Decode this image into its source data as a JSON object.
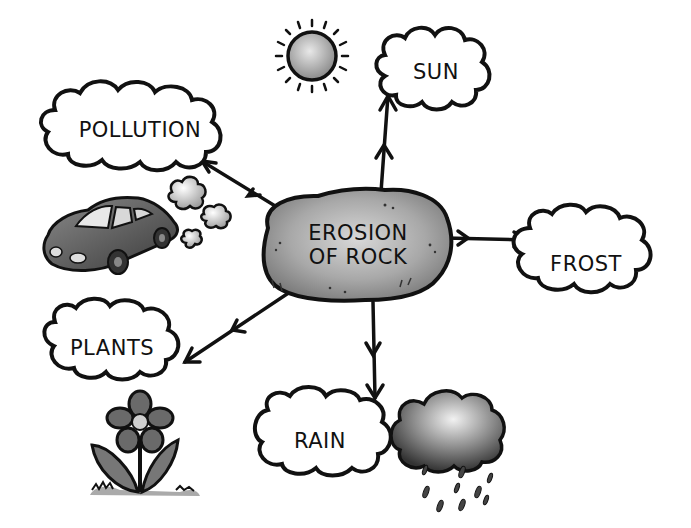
{
  "diagram": {
    "type": "concept-map",
    "center": {
      "id": "erosion",
      "line1": "EROSION",
      "line2": "OF ROCK"
    },
    "nodes": [
      {
        "id": "sun",
        "label": "SUN",
        "illustration": "sun-icon"
      },
      {
        "id": "pollution",
        "label": "POLLUTION",
        "illustration": "car-with-exhaust-icon"
      },
      {
        "id": "frost",
        "label": "FROST"
      },
      {
        "id": "plants",
        "label": "PLANTS",
        "illustration": "flower-icon"
      },
      {
        "id": "rain",
        "label": "RAIN",
        "illustration": "rain-cloud-icon"
      }
    ],
    "edges": [
      {
        "from": "erosion",
        "to": "sun"
      },
      {
        "from": "erosion",
        "to": "pollution"
      },
      {
        "from": "erosion",
        "to": "frost"
      },
      {
        "from": "erosion",
        "to": "plants"
      },
      {
        "from": "erosion",
        "to": "rain"
      }
    ],
    "colors": {
      "ink": "#111111",
      "rock": "#9a9a9a",
      "cloud_fill": "#ffffff",
      "car": "#555555",
      "flower": "#777777",
      "rain_cloud": "#6a6a6a"
    }
  }
}
